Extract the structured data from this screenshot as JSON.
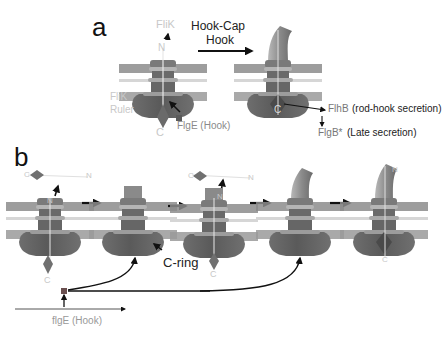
{
  "panel_a": {
    "letter": "a",
    "flik_label": "FliK",
    "n_label": "N",
    "c_label": "C",
    "flik_ruler_label_line1": "FliK",
    "flik_ruler_label_line2": "Ruler",
    "flge_label": "FlgE (Hook)",
    "transition_label_line1": "Hook-Cap",
    "transition_label_line2": "Hook",
    "flhb_label": "FlhB",
    "flhb_desc": "(rod-hook secretion)",
    "flgb_label": "FlgB*",
    "flgb_desc": "(Late secretion)",
    "right_n_label": "N",
    "right_c_label": "C"
  },
  "panel_b": {
    "letter": "b",
    "ruler1_c": "C",
    "ruler1_n": "N",
    "stage1_n": "N",
    "stage1_c": "C",
    "cring_label": "C-ring",
    "ruler3_c": "C",
    "ruler3_n": "N",
    "stage3_n": "N",
    "stage3_c": "C",
    "stage5_n": "N",
    "stage5_c": "C",
    "gene_label": "flgE (Hook)"
  },
  "colors": {
    "membrane": "#8c8c8c",
    "membrane_light": "#d4d4d4",
    "body_dark": "#5f5f5f",
    "body_mid": "#7a7a7a",
    "hook": "#9a9a9a",
    "arrow": "#111111",
    "faint_text": "#c8c8c8"
  }
}
